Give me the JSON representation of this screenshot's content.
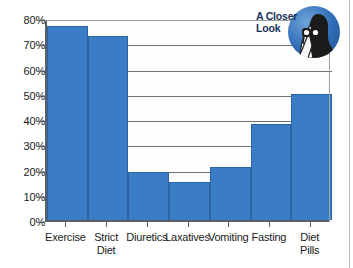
{
  "badge": {
    "title": "A Closer\nLook",
    "icon_name": "person-with-binoculars-icon",
    "circle_color": "#2f6bb5",
    "text_color": "#17325c"
  },
  "chart_data": {
    "type": "bar",
    "title": "",
    "subtitle": "",
    "xlabel": "",
    "ylabel": "",
    "categories": [
      "Exercise",
      "Strict\nDiet",
      "Diuretics",
      "Laxatives",
      "Vomiting",
      "Fasting",
      "Diet\nPills"
    ],
    "values": [
      77,
      73,
      19,
      15,
      21,
      38,
      50
    ],
    "ylim": [
      0,
      80
    ],
    "ytick_values": [
      0,
      10,
      20,
      30,
      40,
      50,
      60,
      70,
      80
    ],
    "ytick_labels": [
      "0%",
      "10%",
      "20%",
      "30%",
      "40%",
      "50%",
      "60%",
      "70%",
      "80%"
    ],
    "grid": true,
    "grid_axis": "y",
    "legend": false,
    "legend_position": "none",
    "bar_color": "#3b7cc6",
    "bar_edge_color": "#2f63a0",
    "axis_color": "#5a5f66",
    "plot_background": "#fdfdfd"
  }
}
